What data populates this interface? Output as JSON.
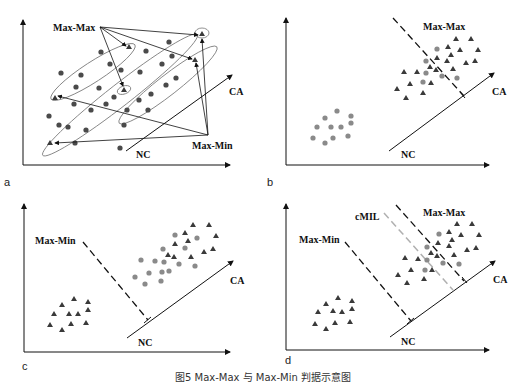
{
  "panels": [
    {
      "id": "a",
      "label": "a",
      "labels": {
        "max_max": "Max-Max",
        "max_min": "Max-Min",
        "ca": "CA",
        "nc": "NC"
      }
    },
    {
      "id": "b",
      "label": "b",
      "labels": {
        "max_max": "Max-Max",
        "ca": "CA",
        "nc": "NC"
      }
    },
    {
      "id": "c",
      "label": "c",
      "labels": {
        "max_min": "Max-Min",
        "ca": "CA",
        "nc": "NC"
      }
    },
    {
      "id": "d",
      "label": "d",
      "labels": {
        "cmil": "cMIL",
        "max_max": "Max-Max",
        "max_min": "Max-Min",
        "ca": "CA",
        "nc": "NC"
      }
    }
  ],
  "caption": "图5 Max-Max 与 Max-Min 判据示意图",
  "colors": {
    "triangle": "#3a3a3a",
    "circle_dark": "#4a4a4a",
    "circle_light": "#8a8a8a",
    "line": "#111111",
    "cmil_line": "#b0b0b0",
    "ellipse": "#666666"
  }
}
